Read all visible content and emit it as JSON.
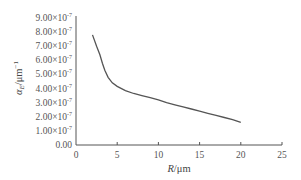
{
  "chart_data": {
    "type": "line",
    "title": "",
    "xlabel": "R/μm",
    "ylabel": "α_E/μm⁻¹",
    "xlim": [
      0,
      25
    ],
    "ylim": [
      0,
      9e-07
    ],
    "grid": false,
    "legend": null,
    "x_ticks": [
      "0",
      "5",
      "10",
      "15",
      "20",
      "25"
    ],
    "y_ticks": [
      "0.00",
      "1.00×10⁻⁷",
      "2.00×10⁻⁷",
      "3.00×10⁻⁷",
      "4.00×10⁻⁷",
      "5.00×10⁻⁷",
      "6.00×10⁻⁷",
      "7.00×10⁻⁷",
      "8.00×10⁻⁷",
      "9.00×10⁻⁷"
    ],
    "series": [
      {
        "name": "α_E",
        "x": [
          2.0,
          2.5,
          2.9,
          3.2,
          3.5,
          3.9,
          4.4,
          5.0,
          6.0,
          7.0,
          8.0,
          9.0,
          10.0,
          11.0,
          12.0,
          13.0,
          14.0,
          15.0,
          16.0,
          17.0,
          18.0,
          19.0,
          20.0
        ],
        "values": [
          7.8e-07,
          7e-07,
          6.4e-07,
          5.8e-07,
          5.3e-07,
          4.8e-07,
          4.4e-07,
          4.15e-07,
          3.85e-07,
          3.65e-07,
          3.5e-07,
          3.35e-07,
          3.2e-07,
          3e-07,
          2.85e-07,
          2.7e-07,
          2.55e-07,
          2.4e-07,
          2.25e-07,
          2.1e-07,
          1.95e-07,
          1.8e-07,
          1.6e-07
        ]
      }
    ]
  },
  "labels": {
    "xlabel_italic": "R",
    "xlabel_rest": "/μm",
    "ylabel_alpha": "α",
    "ylabel_sub": "E",
    "ylabel_rest": "/μm",
    "ylabel_sup": "−1"
  }
}
